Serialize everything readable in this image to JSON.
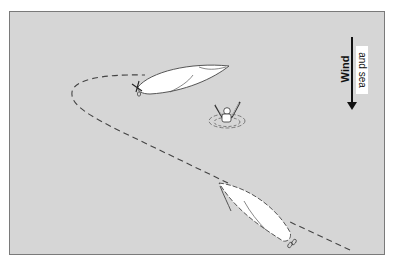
{
  "diagram": {
    "title": "",
    "background_color": "#d6d6d6",
    "border_color": "#7a7a7a",
    "wind_label": "Wind",
    "sea_label": "and sea",
    "wind_direction": "down",
    "elements": [
      {
        "id": "boat-upper",
        "type": "boat",
        "description": "sailboat hull viewed from above, after turning, pointing upwind-right"
      },
      {
        "id": "boat-lower",
        "type": "boat",
        "description": "sailboat hull viewed from above, initial position, heading up-left"
      },
      {
        "id": "person-overboard",
        "type": "person",
        "description": "person in water with raised arms and ripples"
      },
      {
        "id": "course-path",
        "type": "dashed-path",
        "description": "dashed course line from lower right, looping left and back to upper boat"
      },
      {
        "id": "wind-arrow",
        "type": "arrow",
        "description": "downward arrow indicating wind and sea direction"
      }
    ]
  }
}
